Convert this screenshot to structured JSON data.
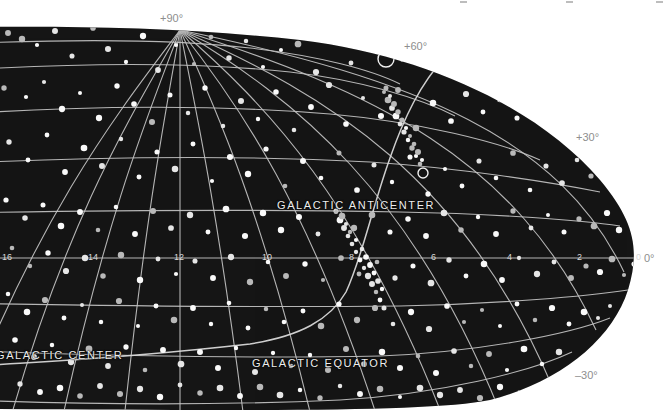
{
  "figure": {
    "kind": "all-sky-star-chart",
    "projection": "elliptical (Aitoff-like) equatorial projection",
    "background_color": "#ffffff",
    "sky_color": "#141414",
    "grid_color": "#c9c9c9",
    "star_color": "#f2f2f2",
    "label_color": "#ededed"
  },
  "declination_labels": [
    {
      "text": "+90°",
      "x": 160,
      "y": 12,
      "on_dark": false
    },
    {
      "text": "+60°",
      "x": 404,
      "y": 40,
      "on_dark": false
    },
    {
      "text": "+30°",
      "x": 576,
      "y": 131,
      "on_dark": false
    },
    {
      "text": "0°",
      "x": 644,
      "y": 252,
      "on_dark": false
    },
    {
      "text": "–30°",
      "x": 575,
      "y": 369,
      "on_dark": false
    }
  ],
  "right_ascension_labels": [
    {
      "text": "16",
      "x": 2,
      "y": 252
    },
    {
      "text": "14",
      "x": 88,
      "y": 252
    },
    {
      "text": "12",
      "x": 174,
      "y": 252
    },
    {
      "text": "10",
      "x": 262,
      "y": 252
    },
    {
      "text": "8",
      "x": 349,
      "y": 252
    },
    {
      "text": "6",
      "x": 431,
      "y": 252
    },
    {
      "text": "4",
      "x": 507,
      "y": 252
    },
    {
      "text": "2",
      "x": 577,
      "y": 252
    },
    {
      "text": "0",
      "x": 636,
      "y": 252
    }
  ],
  "feature_labels": [
    {
      "name": "galactic-anticenter-label",
      "text": "GALACTIC ANTICENTER",
      "x": 277,
      "y": 199
    },
    {
      "name": "galactic-center-label",
      "text": "GALACTIC CENTER",
      "x": -4,
      "y": 349
    },
    {
      "name": "galactic-equator-label",
      "text": "GALACTIC EQUATOR",
      "x": 252,
      "y": 357
    }
  ],
  "markers": [
    {
      "name": "galactic-anticenter-marker",
      "type": "open-circle",
      "cx": 423,
      "cy": 173,
      "r": 5
    },
    {
      "name": "source-ring-marker",
      "type": "open-circle",
      "cx": 386,
      "cy": 59,
      "r": 8
    }
  ],
  "chart_data": {
    "type": "scatter",
    "title": "",
    "xlabel": "Right Ascension (hours)",
    "ylabel": "Declination (degrees)",
    "xlim": [
      16,
      0
    ],
    "ylim": [
      -30,
      90
    ],
    "grid": true,
    "ra_ticks": [
      16,
      14,
      12,
      10,
      8,
      6,
      4,
      2,
      0
    ],
    "dec_ticks": [
      -30,
      0,
      30,
      60,
      90
    ],
    "stars": [
      [
        8,
        33
      ],
      [
        22,
        39
      ],
      [
        37,
        45
      ],
      [
        55,
        31
      ],
      [
        72,
        56
      ],
      [
        93,
        28
      ],
      [
        108,
        49
      ],
      [
        126,
        62
      ],
      [
        143,
        36
      ],
      [
        158,
        70
      ],
      [
        176,
        45
      ],
      [
        194,
        64
      ],
      [
        211,
        37
      ],
      [
        229,
        58
      ],
      [
        246,
        41
      ],
      [
        263,
        67
      ],
      [
        281,
        50
      ],
      [
        298,
        44
      ],
      [
        316,
        72
      ],
      [
        333,
        38
      ],
      [
        351,
        63
      ],
      [
        368,
        47
      ],
      [
        386,
        34
      ],
      [
        403,
        59
      ],
      [
        420,
        52
      ],
      [
        437,
        69
      ],
      [
        455,
        41
      ],
      [
        470,
        57
      ],
      [
        487,
        46
      ],
      [
        504,
        62
      ],
      [
        4,
        88
      ],
      [
        26,
        97
      ],
      [
        44,
        82
      ],
      [
        62,
        109
      ],
      [
        80,
        93
      ],
      [
        99,
        118
      ],
      [
        117,
        86
      ],
      [
        134,
        104
      ],
      [
        152,
        122
      ],
      [
        170,
        95
      ],
      [
        188,
        113
      ],
      [
        205,
        88
      ],
      [
        223,
        126
      ],
      [
        241,
        101
      ],
      [
        258,
        119
      ],
      [
        276,
        92
      ],
      [
        294,
        130
      ],
      [
        311,
        107
      ],
      [
        329,
        85
      ],
      [
        346,
        124
      ],
      [
        363,
        98
      ],
      [
        381,
        116
      ],
      [
        398,
        90
      ],
      [
        416,
        128
      ],
      [
        433,
        103
      ],
      [
        451,
        121
      ],
      [
        466,
        94
      ],
      [
        483,
        112
      ],
      [
        500,
        99
      ],
      [
        517,
        118
      ],
      [
        534,
        107
      ],
      [
        549,
        96
      ],
      [
        563,
        123
      ],
      [
        9,
        142
      ],
      [
        28,
        160
      ],
      [
        47,
        135
      ],
      [
        65,
        172
      ],
      [
        84,
        148
      ],
      [
        102,
        166
      ],
      [
        121,
        139
      ],
      [
        139,
        177
      ],
      [
        157,
        152
      ],
      [
        175,
        169
      ],
      [
        193,
        144
      ],
      [
        212,
        181
      ],
      [
        230,
        157
      ],
      [
        248,
        174
      ],
      [
        266,
        149
      ],
      [
        285,
        186
      ],
      [
        303,
        161
      ],
      [
        321,
        178
      ],
      [
        339,
        153
      ],
      [
        357,
        190
      ],
      [
        374,
        165
      ],
      [
        392,
        182
      ],
      [
        410,
        157
      ],
      [
        428,
        194
      ],
      [
        445,
        169
      ],
      [
        462,
        186
      ],
      [
        479,
        161
      ],
      [
        496,
        178
      ],
      [
        513,
        153
      ],
      [
        530,
        190
      ],
      [
        546,
        166
      ],
      [
        562,
        183
      ],
      [
        577,
        160
      ],
      [
        591,
        176
      ],
      [
        604,
        150
      ],
      [
        615,
        168
      ],
      [
        6,
        200
      ],
      [
        25,
        218
      ],
      [
        43,
        205
      ],
      [
        61,
        226
      ],
      [
        80,
        212
      ],
      [
        98,
        230
      ],
      [
        116,
        207
      ],
      [
        135,
        234
      ],
      [
        153,
        211
      ],
      [
        171,
        228
      ],
      [
        190,
        215
      ],
      [
        208,
        232
      ],
      [
        226,
        209
      ],
      [
        245,
        236
      ],
      [
        263,
        213
      ],
      [
        281,
        230
      ],
      [
        299,
        217
      ],
      [
        318,
        234
      ],
      [
        336,
        211
      ],
      [
        354,
        228
      ],
      [
        372,
        215
      ],
      [
        390,
        232
      ],
      [
        408,
        219
      ],
      [
        426,
        236
      ],
      [
        444,
        213
      ],
      [
        461,
        230
      ],
      [
        478,
        217
      ],
      [
        496,
        234
      ],
      [
        513,
        211
      ],
      [
        531,
        228
      ],
      [
        548,
        215
      ],
      [
        564,
        232
      ],
      [
        579,
        219
      ],
      [
        594,
        226
      ],
      [
        607,
        213
      ],
      [
        619,
        230
      ],
      [
        630,
        218
      ],
      [
        12,
        248
      ],
      [
        30,
        266
      ],
      [
        48,
        253
      ],
      [
        66,
        271
      ],
      [
        85,
        258
      ],
      [
        103,
        276
      ],
      [
        121,
        255
      ],
      [
        140,
        280
      ],
      [
        158,
        259
      ],
      [
        176,
        274
      ],
      [
        195,
        261
      ],
      [
        213,
        278
      ],
      [
        231,
        257
      ],
      [
        250,
        282
      ],
      [
        268,
        262
      ],
      [
        286,
        276
      ],
      [
        305,
        264
      ],
      [
        323,
        280
      ],
      [
        341,
        258
      ],
      [
        359,
        274
      ],
      [
        377,
        262
      ],
      [
        395,
        278
      ],
      [
        413,
        266
      ],
      [
        431,
        283
      ],
      [
        449,
        260
      ],
      [
        466,
        276
      ],
      [
        484,
        264
      ],
      [
        502,
        280
      ],
      [
        519,
        258
      ],
      [
        537,
        274
      ],
      [
        554,
        262
      ],
      [
        571,
        278
      ],
      [
        586,
        266
      ],
      [
        600,
        272
      ],
      [
        612,
        259
      ],
      [
        624,
        275
      ],
      [
        634,
        264
      ],
      [
        8,
        294
      ],
      [
        27,
        312
      ],
      [
        45,
        300
      ],
      [
        64,
        318
      ],
      [
        82,
        305
      ],
      [
        101,
        322
      ],
      [
        119,
        301
      ],
      [
        138,
        326
      ],
      [
        156,
        306
      ],
      [
        174,
        320
      ],
      [
        193,
        308
      ],
      [
        211,
        324
      ],
      [
        229,
        303
      ],
      [
        248,
        328
      ],
      [
        266,
        309
      ],
      [
        284,
        322
      ],
      [
        303,
        311
      ],
      [
        321,
        326
      ],
      [
        339,
        304
      ],
      [
        357,
        320
      ],
      [
        375,
        308
      ],
      [
        393,
        324
      ],
      [
        411,
        312
      ],
      [
        429,
        329
      ],
      [
        447,
        306
      ],
      [
        464,
        322
      ],
      [
        482,
        310
      ],
      [
        500,
        326
      ],
      [
        517,
        304
      ],
      [
        535,
        320
      ],
      [
        552,
        308
      ],
      [
        569,
        324
      ],
      [
        584,
        312
      ],
      [
        598,
        318
      ],
      [
        610,
        306
      ],
      [
        622,
        322
      ],
      [
        632,
        311
      ],
      [
        15,
        340
      ],
      [
        34,
        357
      ],
      [
        52,
        345
      ],
      [
        71,
        362
      ],
      [
        89,
        349
      ],
      [
        108,
        366
      ],
      [
        126,
        347
      ],
      [
        145,
        370
      ],
      [
        163,
        350
      ],
      [
        181,
        364
      ],
      [
        200,
        352
      ],
      [
        218,
        368
      ],
      [
        236,
        348
      ],
      [
        255,
        372
      ],
      [
        273,
        353
      ],
      [
        291,
        366
      ],
      [
        310,
        355
      ],
      [
        328,
        370
      ],
      [
        346,
        349
      ],
      [
        364,
        364
      ],
      [
        382,
        352
      ],
      [
        400,
        368
      ],
      [
        418,
        356
      ],
      [
        436,
        373
      ],
      [
        454,
        351
      ],
      [
        471,
        366
      ],
      [
        489,
        354
      ],
      [
        507,
        370
      ],
      [
        524,
        349
      ],
      [
        542,
        364
      ],
      [
        559,
        352
      ],
      [
        576,
        368
      ],
      [
        590,
        356
      ],
      [
        604,
        362
      ],
      [
        20,
        384
      ],
      [
        40,
        392
      ],
      [
        60,
        388
      ],
      [
        80,
        396
      ],
      [
        100,
        386
      ],
      [
        120,
        394
      ],
      [
        140,
        389
      ],
      [
        160,
        397
      ],
      [
        180,
        385
      ],
      [
        200,
        393
      ],
      [
        220,
        388
      ],
      [
        240,
        396
      ],
      [
        260,
        387
      ],
      [
        280,
        395
      ],
      [
        300,
        390
      ],
      [
        320,
        398
      ],
      [
        340,
        386
      ],
      [
        360,
        394
      ],
      [
        380,
        389
      ],
      [
        400,
        397
      ],
      [
        420,
        388
      ],
      [
        440,
        395
      ],
      [
        460,
        390
      ],
      [
        480,
        398
      ],
      [
        500,
        387
      ],
      [
        520,
        393
      ],
      [
        540,
        389
      ],
      [
        556,
        395
      ],
      [
        572,
        386
      ],
      [
        348,
        236
      ],
      [
        352,
        244
      ],
      [
        356,
        252
      ],
      [
        360,
        260
      ],
      [
        364,
        268
      ],
      [
        368,
        276
      ],
      [
        372,
        284
      ],
      [
        376,
        292
      ],
      [
        380,
        300
      ],
      [
        384,
        308
      ],
      [
        344,
        228
      ],
      [
        340,
        220
      ],
      [
        336,
        212
      ],
      [
        392,
        108
      ],
      [
        396,
        116
      ],
      [
        400,
        124
      ],
      [
        404,
        132
      ],
      [
        408,
        140
      ],
      [
        412,
        148
      ],
      [
        416,
        156
      ],
      [
        420,
        164
      ],
      [
        388,
        100
      ],
      [
        384,
        92
      ],
      [
        356,
        240
      ],
      [
        362,
        249
      ],
      [
        366,
        257
      ],
      [
        370,
        265
      ],
      [
        374,
        273
      ],
      [
        378,
        281
      ],
      [
        382,
        289
      ],
      [
        350,
        232
      ],
      [
        346,
        224
      ],
      [
        342,
        216
      ],
      [
        398,
        112
      ],
      [
        402,
        120
      ],
      [
        406,
        128
      ],
      [
        410,
        136
      ],
      [
        414,
        144
      ],
      [
        418,
        152
      ],
      [
        422,
        160
      ],
      [
        394,
        104
      ],
      [
        390,
        96
      ],
      [
        386,
        88
      ]
    ],
    "dense_band_note": "concentration of sources along the galactic equator"
  }
}
